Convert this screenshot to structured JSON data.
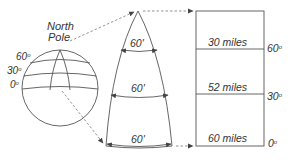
{
  "globe": {
    "pole_label_line1": "North",
    "pole_label_line2": "Pole",
    "latitudes": [
      {
        "label": "60",
        "sup": "o"
      },
      {
        "label": "30",
        "sup": "o"
      },
      {
        "label": "0",
        "sup": "o"
      }
    ]
  },
  "gore": {
    "width_labels": [
      "60'",
      "60'",
      "60'"
    ]
  },
  "projection": {
    "distances": [
      "30 miles",
      "52 miles",
      "60 miles"
    ],
    "latitudes": [
      {
        "label": "60",
        "sup": "o"
      },
      {
        "label": "30",
        "sup": "o"
      },
      {
        "label": "0",
        "sup": "o"
      }
    ]
  },
  "colors": {
    "line": "#555555",
    "text": "#333333"
  }
}
